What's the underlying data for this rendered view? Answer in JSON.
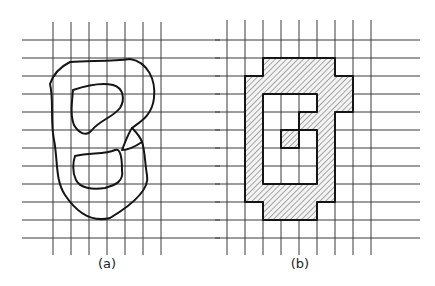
{
  "figure": {
    "panels": [
      {
        "id": "a",
        "label": "(a)",
        "description": "Continuous region with two holes overlaid on a square grid",
        "grid": {
          "vertical_x": [
            53,
            71,
            89,
            107,
            125,
            143,
            161
          ],
          "horizontal_y": [
            40,
            58,
            76,
            94,
            112,
            130,
            148,
            166,
            184,
            202,
            220,
            238
          ],
          "h_extent": [
            22,
            220
          ],
          "v_extent": [
            22,
            255
          ]
        },
        "label_pos": [
          107,
          268
        ]
      },
      {
        "id": "b",
        "label": "(b)",
        "description": "Digitized (cell-quantized) version of the region on the grid",
        "grid": {
          "vertical_x": [
            227,
            245,
            263,
            281,
            299,
            317,
            335,
            353,
            371
          ],
          "horizontal_y": [
            40,
            58,
            76,
            94,
            112,
            130,
            148,
            166,
            184,
            202,
            220,
            238
          ],
          "h_extent": [
            215,
            420
          ],
          "v_extent": [
            20,
            255
          ],
          "cell": 18,
          "origin": [
            227,
            40
          ]
        },
        "shaded_cells_by_row": {
          "1": [
            2,
            3,
            4,
            5
          ],
          "2": [
            1,
            2,
            3,
            4,
            5,
            6
          ],
          "3": [
            1,
            5,
            6
          ],
          "4": [
            1,
            4,
            5
          ],
          "5": [
            1,
            3,
            5
          ],
          "6": [
            1,
            5
          ],
          "7": [
            1,
            5
          ],
          "8": [
            1,
            2,
            3,
            4,
            5
          ],
          "9": [
            2,
            3,
            4
          ]
        },
        "label_pos": [
          300,
          268
        ]
      }
    ],
    "colors": {
      "background": "#ffffff",
      "grid": "#3a3a3a",
      "outline": "#151515",
      "hatch": "#555555",
      "fill": "#f2f2f2"
    }
  }
}
